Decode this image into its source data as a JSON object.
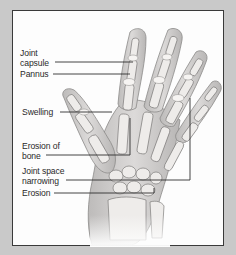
{
  "figure": {
    "labels": [
      {
        "id": "joint-capsule",
        "line1": "Joint",
        "line2": "capsule"
      },
      {
        "id": "pannus",
        "line1": "Pannus"
      },
      {
        "id": "swelling",
        "line1": "Swelling"
      },
      {
        "id": "erosion-of-bone",
        "line1": "Erosion of",
        "line2": "bone"
      },
      {
        "id": "joint-space-narrowing",
        "line1": "Joint space",
        "line2": "narrowing"
      },
      {
        "id": "erosion",
        "line1": "Erosion"
      }
    ]
  },
  "colors": {
    "background": "#c9c9c9",
    "panel": "#fdfdfd",
    "border": "#3a3a3a",
    "text": "#2a2a2a",
    "bone": "#e8e6e4",
    "bone_outline": "#8a8a8a",
    "skin": "#d6d4d3"
  }
}
